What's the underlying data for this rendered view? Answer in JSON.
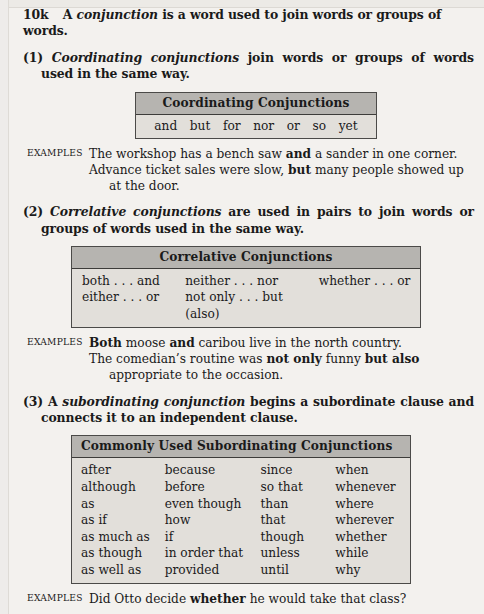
{
  "page": {
    "section_number": "10k",
    "section_rule_parts": {
      "lead": "A ",
      "italic": "conjunction",
      "tail": " is a word used to join words or groups of words."
    }
  },
  "rules": [
    {
      "number": "(1)",
      "italic": "Coordinating conjunctions",
      "text": " join words or groups of words used in the same way."
    },
    {
      "number": "(2)",
      "italic": "Correlative conjunctions",
      "text": " are used in pairs to join words or groups of words used in the same way."
    },
    {
      "number": "(3)",
      "lead": "A ",
      "italic": "subordinating conjunction",
      "text": " begins a subordinate clause and connects it to an independent clause."
    }
  ],
  "tables": {
    "coordinating": {
      "title": "Coordinating Conjunctions",
      "words": [
        "and",
        "but",
        "for",
        "nor",
        "or",
        "so",
        "yet"
      ]
    },
    "correlative": {
      "title": "Correlative Conjunctions",
      "columns": [
        [
          "both . . . and",
          "either . . . or"
        ],
        [
          "neither . . . nor",
          "not only . . . but (also)"
        ],
        [
          "whether . . . or",
          ""
        ]
      ]
    },
    "subordinating": {
      "title": "Commonly Used Subordinating Conjunctions",
      "columns": [
        [
          "after",
          "although",
          "as",
          "as if",
          "as much as",
          "as though",
          "as well as"
        ],
        [
          "because",
          "before",
          "even though",
          "how",
          "if",
          "in order that",
          "provided"
        ],
        [
          "since",
          "so that",
          "than",
          "that",
          "though",
          "unless",
          "until"
        ],
        [
          "when",
          "whenever",
          "where",
          "wherever",
          "whether",
          "while",
          "why"
        ]
      ]
    }
  },
  "examples": [
    {
      "label": "EXAMPLES",
      "lines": [
        [
          {
            "t": "The workshop has a bench saw ",
            "b": false
          },
          {
            "t": "and",
            "b": true
          },
          {
            "t": " a sander in one corner.",
            "b": false
          }
        ],
        [
          {
            "t": "Advance ticket sales were slow, ",
            "b": false
          },
          {
            "t": "but",
            "b": true
          },
          {
            "t": " many people showed up",
            "b": false
          }
        ],
        [
          {
            "t": "at the door.",
            "b": false,
            "indent": true
          }
        ]
      ]
    },
    {
      "label": "EXAMPLES",
      "lines": [
        [
          {
            "t": "Both",
            "b": true
          },
          {
            "t": " moose ",
            "b": false
          },
          {
            "t": "and",
            "b": true
          },
          {
            "t": " caribou live in the north country.",
            "b": false
          }
        ],
        [
          {
            "t": "The comedian’s routine was ",
            "b": false
          },
          {
            "t": "not only",
            "b": true
          },
          {
            "t": " funny ",
            "b": false
          },
          {
            "t": "but also",
            "b": true
          }
        ],
        [
          {
            "t": "appropriate to the occasion.",
            "b": false,
            "indent": true
          }
        ]
      ]
    },
    {
      "label": "EXAMPLES",
      "lines": [
        [
          {
            "t": "Did Otto decide ",
            "b": false
          },
          {
            "t": "whether",
            "b": true
          },
          {
            "t": " he would take that class?",
            "b": false
          }
        ]
      ]
    }
  ],
  "colors": {
    "page_background": "#f3f1ee",
    "table_header_fill": "#b6b4b0",
    "table_body_fill": "#e2dfda",
    "table_border": "#4b4a48",
    "text": "#1a1a1a"
  }
}
